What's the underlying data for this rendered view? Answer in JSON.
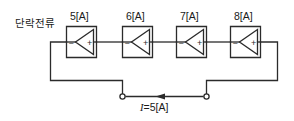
{
  "figure": {
    "width": 294,
    "height": 121,
    "background_color": "#ffffff",
    "line_color": "#2b2b2b",
    "text_color": "#1a1a1a"
  },
  "annotations": {
    "circuit_label": "단락전류",
    "current_label_prefix": "I",
    "current_label_value": "=5[A]",
    "current_label_full": "I=5[A]"
  },
  "sources": [
    {
      "label": "5[A]",
      "value": 5,
      "unit": "A",
      "symbol": "current-source",
      "polarity_left": "−",
      "polarity_right": "+",
      "arrow_direction": "left"
    },
    {
      "label": "6[A]",
      "value": 6,
      "unit": "A",
      "symbol": "current-source",
      "polarity_left": "−",
      "polarity_right": "+",
      "arrow_direction": "left"
    },
    {
      "label": "7[A]",
      "value": 7,
      "unit": "A",
      "symbol": "current-source",
      "polarity_left": "−",
      "polarity_right": "+",
      "arrow_direction": "left"
    },
    {
      "label": "8[A]",
      "value": 8,
      "unit": "A",
      "symbol": "current-source",
      "polarity_left": "−",
      "polarity_right": "+",
      "arrow_direction": "left"
    }
  ],
  "terminals": [
    {
      "name": "left-terminal",
      "type": "open-node"
    },
    {
      "name": "right-terminal",
      "type": "open-node"
    }
  ]
}
